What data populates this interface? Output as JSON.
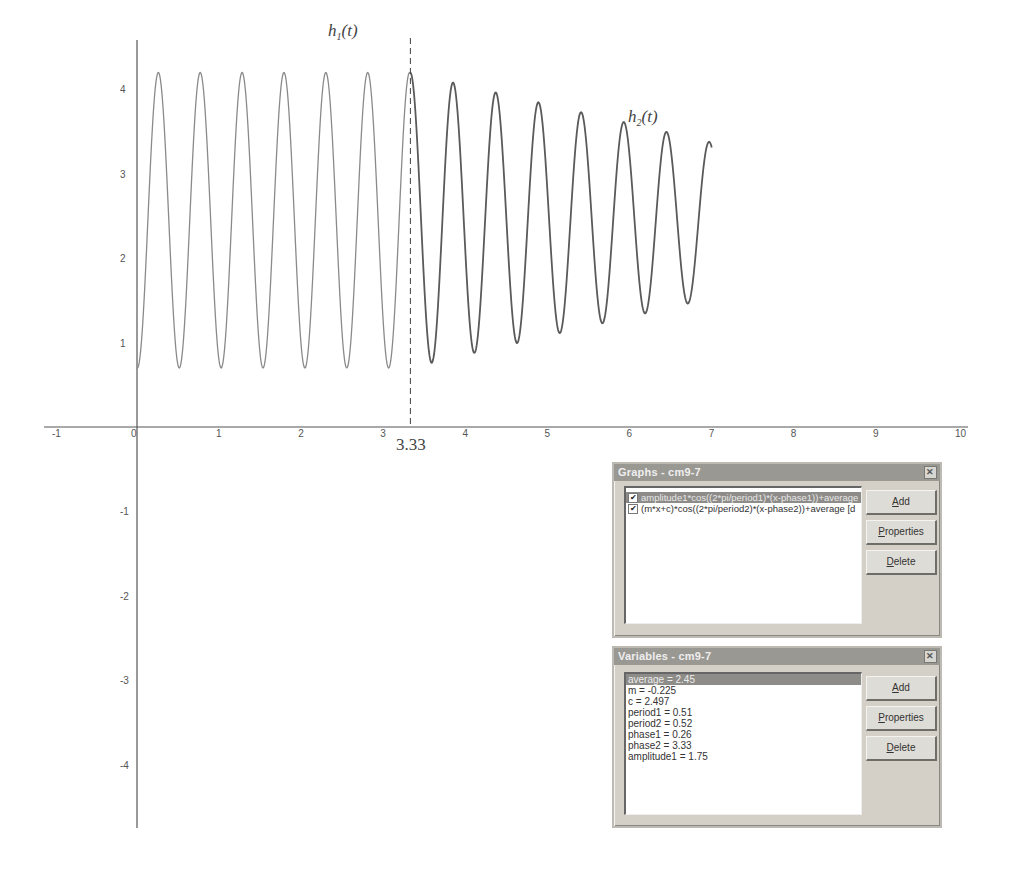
{
  "chart_data": {
    "type": "line",
    "title": "",
    "xlabel": "",
    "ylabel": "",
    "xlim": [
      -1,
      10
    ],
    "ylim": [
      -4.8,
      4.6
    ],
    "grid": false,
    "x_ticks": [
      -1,
      0,
      1,
      2,
      3,
      4,
      5,
      6,
      7,
      8,
      9,
      10
    ],
    "x_tick_labels": [
      "-1",
      "0",
      "1",
      "2",
      "3",
      "4",
      "5",
      "6",
      "7",
      "8",
      "9",
      "10"
    ],
    "y_ticks": [
      4,
      3,
      2,
      1,
      -1,
      -2,
      -3,
      -4
    ],
    "y_tick_labels": [
      "4",
      "3",
      "2",
      "1",
      "-1",
      "-2",
      "-3",
      "-4"
    ],
    "series": [
      {
        "name": "h1(t)",
        "formula": "amplitude1*cos((2*pi/period1)*(x-phase1))+average",
        "domain": [
          0,
          3.33
        ],
        "color": "#8a8a8a",
        "params": {
          "amplitude1": 1.75,
          "period1": 0.51,
          "phase1": 0.26,
          "average": 2.45
        }
      },
      {
        "name": "h2(t)",
        "formula": "(m*x+c)*cos((2*pi/period2)*(x-phase2))+average",
        "domain": [
          3.33,
          7
        ],
        "color": "#5a5a5a",
        "params": {
          "m": -0.225,
          "c": 2.497,
          "period2": 0.52,
          "phase2": 3.33,
          "average": 2.45
        }
      }
    ],
    "annotations": [
      {
        "text": "h",
        "subscript": "1",
        "suffix": "(t)",
        "x": 2.3,
        "y": 4.65
      },
      {
        "text": "h",
        "subscript": "2",
        "suffix": "(t)",
        "x": 5.98,
        "y": 3.65
      },
      {
        "type": "vline",
        "x": 3.33,
        "style": "dashed",
        "label": "3.33"
      }
    ]
  },
  "graphs_window": {
    "title": "Graphs - cm9-7",
    "close_icon": "close-icon",
    "items": [
      {
        "checked": true,
        "label": "amplitude1*cos((2*pi/period1)*(x-phase1))+average",
        "selected": true
      },
      {
        "checked": true,
        "label": "(m*x+c)*cos((2*pi/period2)*(x-phase2))+average [d",
        "selected": false
      }
    ],
    "buttons": {
      "add": {
        "accel": "A",
        "rest": "dd"
      },
      "properties": {
        "accel": "P",
        "rest": "roperties"
      },
      "delete": {
        "accel": "D",
        "rest": "elete"
      }
    }
  },
  "variables_window": {
    "title": "Variables - cm9-7",
    "close_icon": "close-icon",
    "items": [
      {
        "label": "average = 2.45",
        "selected": true
      },
      {
        "label": "m = -0.225",
        "selected": false
      },
      {
        "label": "c = 2.497",
        "selected": false
      },
      {
        "label": "period1 = 0.51",
        "selected": false
      },
      {
        "label": "period2 = 0.52",
        "selected": false
      },
      {
        "label": "phase1 = 0.26",
        "selected": false
      },
      {
        "label": "phase2 = 3.33",
        "selected": false
      },
      {
        "label": "amplitude1 = 1.75",
        "selected": false
      }
    ],
    "buttons": {
      "add": {
        "accel": "A",
        "rest": "dd"
      },
      "properties": {
        "accel": "P",
        "rest": "roperties"
      },
      "delete": {
        "accel": "D",
        "rest": "elete"
      }
    }
  }
}
